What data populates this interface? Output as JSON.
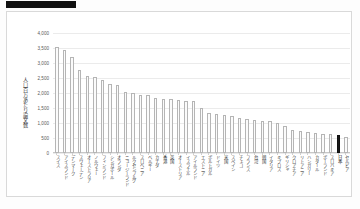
{
  "header": {
    "redaction_bar": ""
  },
  "chart_data": {
    "type": "bar",
    "title": "",
    "xlabel": "",
    "ylabel": "人口百万あたり論文数",
    "ylim": [
      0,
      4000
    ],
    "ytick_labels": [
      "4,000",
      "3,500",
      "3,000",
      "2,500",
      "2,000",
      "1,500",
      "1,000",
      "500",
      "0"
    ],
    "ytick_values": [
      4000,
      3500,
      3000,
      2500,
      2000,
      1500,
      1000,
      500,
      0
    ],
    "grid": true,
    "legend": "none",
    "highlight_category": "日本",
    "highlight_color": "#1a1a1a",
    "bar_color": "#fbfbfb",
    "bar_border_color": "#b5b5b5",
    "categories": [
      "スイス",
      "アイスランド",
      "デンマーク",
      "スウェーデン",
      "オーストラリア",
      "ノルウェー",
      "フィンランド",
      "シンガポール",
      "オランダ",
      "ニュージーランド",
      "ルクセンブルグ",
      "スロベニア",
      "ベルギー",
      "カナダ",
      "香港",
      "英国",
      "オーストリア",
      "イスラエル",
      "アイルランド",
      "エストニア",
      "ポルトガル",
      "ドイツ",
      "米国",
      "スペイン",
      "チェコ",
      "フランス",
      "台湾",
      "韓国",
      "イタリア",
      "キプロス",
      "ギリシャ",
      "クロアチア",
      "リトアニア",
      "ハンガリー",
      "カタール",
      "ポーランド",
      "スロバキア",
      "日本",
      "セルビア"
    ],
    "values": [
      3530,
      3450,
      3200,
      2760,
      2560,
      2550,
      2420,
      2290,
      2280,
      2040,
      2010,
      1940,
      1940,
      1820,
      1800,
      1800,
      1760,
      1740,
      1720,
      1510,
      1350,
      1300,
      1270,
      1230,
      1170,
      1130,
      1100,
      1080,
      1070,
      1010,
      890,
      780,
      730,
      700,
      660,
      640,
      620,
      600,
      540
    ]
  }
}
